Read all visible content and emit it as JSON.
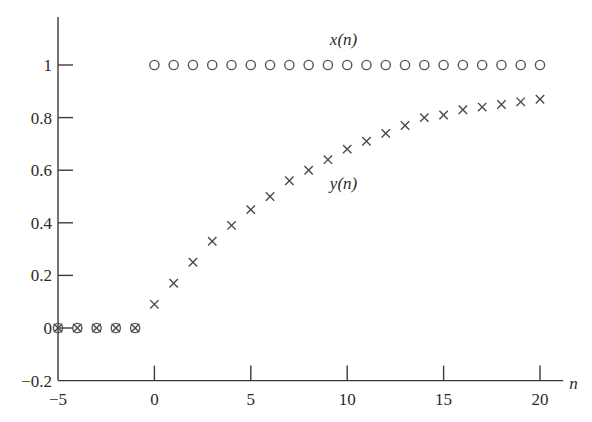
{
  "chart_data": {
    "type": "scatter",
    "title": "",
    "xlabel": "n",
    "ylabel": "",
    "xlim": [
      -5,
      21.2
    ],
    "ylim": [
      -0.2,
      1.2
    ],
    "grid": false,
    "legend": "inline labels",
    "x_ticks": [
      -5,
      0,
      5,
      10,
      15,
      20
    ],
    "x_tick_labels": [
      "−5",
      "0",
      "5",
      "10",
      "15",
      "20"
    ],
    "y_ticks": [
      -0.2,
      0,
      0.2,
      0.4,
      0.6,
      0.8,
      1
    ],
    "y_tick_labels": [
      "−0.2",
      "0",
      "0.2",
      "0.4",
      "0.6",
      "0.8",
      "1"
    ],
    "series": [
      {
        "name": "x(n)",
        "marker": "circle",
        "label_pos": {
          "n": 9.1,
          "y": 1.1
        },
        "x": [
          -5,
          -4,
          -3,
          -2,
          -1,
          0,
          1,
          2,
          3,
          4,
          5,
          6,
          7,
          8,
          9,
          10,
          11,
          12,
          13,
          14,
          15,
          16,
          17,
          18,
          19,
          20
        ],
        "values": [
          0,
          0,
          0,
          0,
          0,
          1,
          1,
          1,
          1,
          1,
          1,
          1,
          1,
          1,
          1,
          1,
          1,
          1,
          1,
          1,
          1,
          1,
          1,
          1,
          1,
          1
        ]
      },
      {
        "name": "y(n)",
        "marker": "cross",
        "label_pos": {
          "n": 9.1,
          "y": 0.55
        },
        "x": [
          -5,
          -4,
          -3,
          -2,
          -1,
          0,
          1,
          2,
          3,
          4,
          5,
          6,
          7,
          8,
          9,
          10,
          11,
          12,
          13,
          14,
          15,
          16,
          17,
          18,
          19,
          20
        ],
        "values": [
          0,
          0,
          0,
          0,
          0,
          0.09,
          0.17,
          0.25,
          0.33,
          0.39,
          0.45,
          0.5,
          0.56,
          0.6,
          0.64,
          0.68,
          0.71,
          0.74,
          0.77,
          0.8,
          0.81,
          0.83,
          0.84,
          0.85,
          0.86,
          0.87
        ]
      }
    ]
  }
}
